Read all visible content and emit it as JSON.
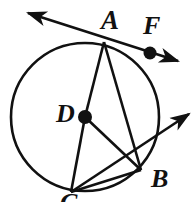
{
  "figure": {
    "type": "geometry-diagram",
    "canvas": {
      "width": 195,
      "height": 202
    },
    "stroke_color": "#111111",
    "background_color": "#ffffff",
    "circle": {
      "name": "circle-D",
      "cx": 85,
      "cy": 117,
      "r": 74
    },
    "points": [
      {
        "id": "A",
        "label": "A",
        "x": 104,
        "y": 42,
        "dot": false,
        "label_x": 101,
        "label_y": 7
      },
      {
        "id": "F",
        "label": "F",
        "x": 150,
        "y": 53,
        "dot": true,
        "label_x": 143,
        "label_y": 13
      },
      {
        "id": "D",
        "label": "D",
        "x": 85,
        "y": 117,
        "dot": true,
        "label_x": 56,
        "label_y": 101
      },
      {
        "id": "B",
        "label": "B",
        "x": 141,
        "y": 170,
        "dot": false,
        "label_x": 151,
        "label_y": 166
      },
      {
        "id": "C",
        "label": "C",
        "x": 71,
        "y": 192,
        "dot": false,
        "label_x": 60,
        "label_y": 190
      }
    ],
    "segments": [
      {
        "name": "segment-AD",
        "from": "A",
        "to": "D"
      },
      {
        "name": "segment-AB",
        "from": "A",
        "to": "B"
      },
      {
        "name": "segment-DB",
        "from": "D",
        "to": "B"
      },
      {
        "name": "segment-DC",
        "from": "D",
        "to": "C"
      },
      {
        "name": "segment-CB",
        "from": "C",
        "to": "B"
      }
    ],
    "rays": [
      {
        "name": "tangent-line-at-A",
        "through": [
          "A",
          "F"
        ],
        "arrow_start": true,
        "arrow_end": true
      },
      {
        "name": "ray-through-B",
        "through": [
          "C",
          "B"
        ],
        "arrow_start": false,
        "arrow_end": true
      }
    ]
  }
}
